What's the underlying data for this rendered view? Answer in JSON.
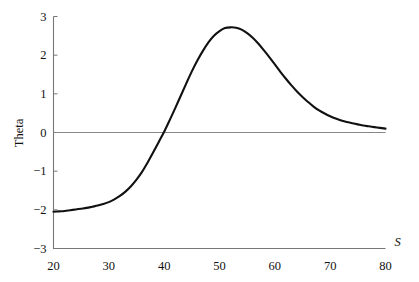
{
  "chart_data": {
    "type": "line",
    "title": "",
    "xlabel": "S",
    "ylabel": "Theta",
    "xlim": [
      20,
      80
    ],
    "ylim": [
      -3,
      3
    ],
    "xticks": [
      "20",
      "30",
      "40",
      "50",
      "60",
      "70",
      "80"
    ],
    "yticks": [
      "3",
      "2",
      "1",
      "0",
      "-1",
      "-2",
      "-3"
    ],
    "xtick_values": [
      20,
      30,
      40,
      50,
      60,
      70,
      80
    ],
    "ytick_values": [
      3,
      2,
      1,
      0,
      -1,
      -2,
      -3
    ],
    "grid": false,
    "legend": null,
    "zero_line": true,
    "series": [
      {
        "name": "Theta",
        "color": "#111111",
        "x": [
          20,
          21,
          22,
          23,
          24,
          25,
          26,
          27,
          28,
          29,
          30,
          31,
          32,
          33,
          34,
          35,
          36,
          37,
          38,
          39,
          40,
          41,
          42,
          43,
          44,
          45,
          46,
          47,
          48,
          49,
          50,
          51,
          52,
          53,
          54,
          55,
          56,
          57,
          58,
          59,
          60,
          61,
          62,
          63,
          64,
          65,
          66,
          67,
          68,
          69,
          70,
          71,
          72,
          73,
          74,
          75,
          76,
          77,
          78,
          79,
          80
        ],
        "values": [
          -2.05,
          -2.04,
          -2.03,
          -2.01,
          -1.99,
          -1.97,
          -1.95,
          -1.92,
          -1.89,
          -1.85,
          -1.8,
          -1.73,
          -1.64,
          -1.53,
          -1.39,
          -1.22,
          -1.02,
          -0.78,
          -0.52,
          -0.25,
          0.02,
          0.32,
          0.63,
          0.95,
          1.27,
          1.58,
          1.86,
          2.11,
          2.33,
          2.5,
          2.62,
          2.7,
          2.72,
          2.71,
          2.66,
          2.57,
          2.45,
          2.3,
          2.13,
          1.95,
          1.76,
          1.57,
          1.39,
          1.22,
          1.06,
          0.92,
          0.79,
          0.67,
          0.57,
          0.49,
          0.42,
          0.36,
          0.31,
          0.27,
          0.24,
          0.21,
          0.18,
          0.16,
          0.14,
          0.12,
          0.1
        ]
      }
    ],
    "annotations": {
      "zero_crossing_x": 40,
      "peak_x": 52,
      "peak_y": 2.72,
      "start_y": -2.05,
      "end_y": 0.1
    },
    "colors": {
      "curve": "#111111",
      "axis": "#777777",
      "zero_line": "#888888",
      "background": "#ffffff",
      "text": "#111111"
    }
  }
}
